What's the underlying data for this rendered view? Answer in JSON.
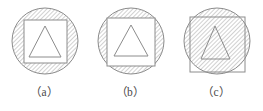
{
  "figure": {
    "background_color": "#ffffff",
    "stroke_color": "#8c8c8c",
    "hatch_color": "#9a9a9a",
    "caption_color": "#4a4a4a",
    "hatch_angle_degrees": 45,
    "hatch_spacing_px": 3,
    "panels": [
      {
        "id": "a",
        "caption": "（a）",
        "circle": {
          "cx": 45,
          "cy": 41,
          "r": 33,
          "hatched": true
        },
        "square": {
          "x": 24,
          "y": 20,
          "size": 43,
          "hatched": false
        },
        "triangle": {
          "apex_x": 45,
          "apex_y": 26,
          "base_left_x": 29,
          "base_right_x": 61,
          "base_y": 57,
          "hatched": false
        }
      },
      {
        "id": "b",
        "caption": "（b）",
        "circle": {
          "cx": 45,
          "cy": 41,
          "r": 33,
          "hatched": true
        },
        "square": {
          "x": 21,
          "y": 18,
          "size": 48,
          "hatched": false
        },
        "triangle": {
          "apex_x": 45,
          "apex_y": 25,
          "base_left_x": 28,
          "base_right_x": 62,
          "base_y": 56,
          "hatched": false
        }
      },
      {
        "id": "c",
        "caption": "（c）",
        "circle": {
          "cx": 45,
          "cy": 41,
          "r": 33,
          "hatched": true
        },
        "square": {
          "x": 18,
          "y": 17,
          "size": 55,
          "hatched": true
        },
        "triangle": {
          "apex_x": 43,
          "apex_y": 26,
          "base_left_x": 29,
          "base_right_x": 58,
          "base_y": 59,
          "hatched": true
        }
      }
    ]
  }
}
